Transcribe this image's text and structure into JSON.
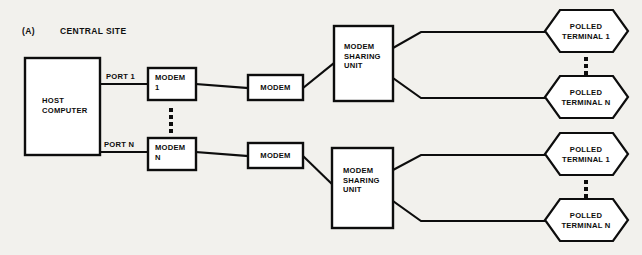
{
  "figure": {
    "label": "(A)",
    "title": "CENTRAL SITE"
  },
  "diagram": {
    "type": "network-topology",
    "host": {
      "name": "HOST\nCOMPUTER"
    },
    "ports": [
      {
        "label": "PORT 1"
      },
      {
        "label": "PORT N"
      }
    ],
    "host_modems": [
      {
        "label": "MODEM\n1"
      },
      {
        "label": "MODEM\nN"
      }
    ],
    "line_modems": [
      {
        "label": "MODEM"
      },
      {
        "label": "MODEM"
      }
    ],
    "sharing_units": [
      {
        "label": "MODEM\nSHARING\nUNIT"
      },
      {
        "label": "MODEM\nSHARING\nUNIT"
      }
    ],
    "terminal_groups": [
      {
        "terminals": [
          {
            "label": "POLLED\nTERMINAL 1"
          },
          {
            "label": "POLLED\nTERMINAL N"
          }
        ]
      },
      {
        "terminals": [
          {
            "label": "POLLED\nTERMINAL 1"
          },
          {
            "label": "POLLED\nTERMINAL N"
          }
        ]
      }
    ],
    "colors": {
      "ink": "#0d0d0d",
      "paper": "#f2f1ed",
      "node_fill": "#ffffff"
    }
  }
}
